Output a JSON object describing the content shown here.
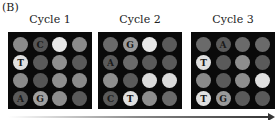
{
  "figure_label": "(B)",
  "cycles": [
    {
      "title": "Cycle 1",
      "left": 8,
      "dots": [
        [
          "#8a8a8a",
          ""
        ],
        [
          "#555555",
          "C"
        ],
        [
          "#e6e6e6",
          ""
        ],
        [
          "#8a8a8a",
          ""
        ],
        [
          "#e0e0e0",
          "T"
        ],
        [
          "#5a5a5a",
          ""
        ],
        [
          "#8e8e8e",
          ""
        ],
        [
          "#5a5a5a",
          ""
        ],
        [
          "#8a8a8a",
          ""
        ],
        [
          "#555555",
          ""
        ],
        [
          "#8e8e8e",
          ""
        ],
        [
          "#8a8a8a",
          ""
        ],
        [
          "#5a5a5a",
          "A"
        ],
        [
          "#a0a0a0",
          "G"
        ],
        [
          "#8e8e8e",
          ""
        ],
        [
          "#5a5a5a",
          ""
        ]
      ]
    },
    {
      "title": "Cycle 2",
      "left": 98,
      "dots": [
        [
          "#6a6a6a",
          ""
        ],
        [
          "#9a9a9a",
          "G"
        ],
        [
          "#e6e6e6",
          ""
        ],
        [
          "#5a5a5a",
          ""
        ],
        [
          "#5a5a5a",
          "A"
        ],
        [
          "#6a6a6a",
          ""
        ],
        [
          "#5a5a5a",
          ""
        ],
        [
          "#5a5a5a",
          ""
        ],
        [
          "#8e8e8e",
          ""
        ],
        [
          "#5a5a5a",
          ""
        ],
        [
          "#dadada",
          ""
        ],
        [
          "#dadada",
          ""
        ],
        [
          "#5a5a5a",
          "C"
        ],
        [
          "#e0e0e0",
          "T"
        ],
        [
          "#8e8e8e",
          ""
        ],
        [
          "#6a6a6a",
          ""
        ]
      ]
    },
    {
      "title": "Cycle 3",
      "left": 191,
      "dots": [
        [
          "#6a6a6a",
          ""
        ],
        [
          "#5a5a5a",
          "A"
        ],
        [
          "#6a6a6a",
          ""
        ],
        [
          "#6a6a6a",
          ""
        ],
        [
          "#e0e0e0",
          "T"
        ],
        [
          "#5a5a5a",
          ""
        ],
        [
          "#8e8e8e",
          ""
        ],
        [
          "#5a5a5a",
          ""
        ],
        [
          "#8a8a8a",
          ""
        ],
        [
          "#5a5a5a",
          ""
        ],
        [
          "#8e8e8e",
          ""
        ],
        [
          "#e0e0e0",
          ""
        ],
        [
          "#e0e0e0",
          "T"
        ],
        [
          "#9a9a9a",
          "G"
        ],
        [
          "#5a5a5a",
          ""
        ],
        [
          "#5a5a5a",
          ""
        ]
      ]
    }
  ]
}
